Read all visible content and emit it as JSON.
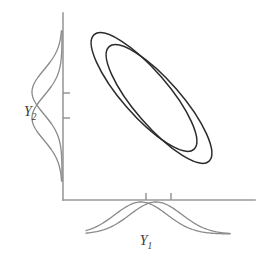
{
  "figure": {
    "background_color": "#ffffff",
    "width": 260,
    "height": 256
  },
  "labels": {
    "x_axis": {
      "base": "Y",
      "subscript": "1",
      "full": "Y1"
    },
    "y_axis": {
      "base": "Y",
      "subscript": "2",
      "full": "Y2"
    }
  },
  "axes": {
    "color": "#9a9a9a",
    "origin": {
      "x": 63,
      "y": 200
    },
    "y_axis_top": {
      "x": 63,
      "y": 13
    },
    "x_axis_right": {
      "x": 255,
      "y": 200
    },
    "x_ticks": [
      {
        "position": 146,
        "length": 7
      },
      {
        "position": 171,
        "length": 7
      }
    ],
    "y_ticks": [
      {
        "position": 93,
        "length": 7
      },
      {
        "position": 118,
        "length": 7
      }
    ]
  },
  "chart_data": {
    "type": "scatter",
    "xlabel": "Y1",
    "ylabel": "Y2",
    "grid": false,
    "legend": "none",
    "ellipses": [
      {
        "name": "ellipse-group-1",
        "center_x": 144,
        "center_y": 92,
        "semi_major": 76,
        "semi_minor": 23,
        "rotation_deg": -41,
        "stroke_color": "#2b2b2b",
        "stroke_width": 1.5
      },
      {
        "name": "ellipse-group-2",
        "center_x": 159,
        "center_y": 104,
        "semi_major": 76,
        "semi_minor": 23,
        "rotation_deg": -41,
        "stroke_color": "#2b2b2b",
        "stroke_width": 1.5
      }
    ],
    "marginal_x": {
      "orientation": "horizontal",
      "baseline_y": 202,
      "direction": "downward",
      "curves": [
        {
          "name": "marginal-x-curve-1",
          "mean": 141,
          "sigma": 26,
          "amplitude": 32,
          "stroke_color": "#8a8a8a"
        },
        {
          "name": "marginal-x-curve-2",
          "mean": 156,
          "sigma": 26,
          "amplitude": 32,
          "stroke_color": "#8a8a8a"
        }
      ]
    },
    "marginal_y": {
      "orientation": "vertical",
      "baseline_x": 62,
      "direction": "leftward",
      "curves": [
        {
          "name": "marginal-y-curve-1",
          "mean": 92,
          "sigma": 22,
          "amplitude": 30,
          "stroke_color": "#8a8a8a"
        },
        {
          "name": "marginal-y-curve-2",
          "mean": 118,
          "sigma": 22,
          "amplitude": 30,
          "stroke_color": "#8a8a8a"
        }
      ]
    }
  }
}
